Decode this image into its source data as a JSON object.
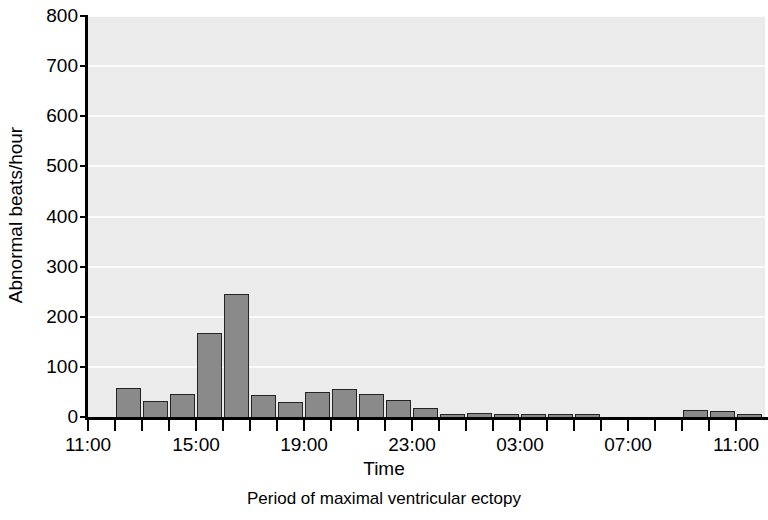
{
  "chart_data": {
    "type": "bar",
    "title": "",
    "xlabel": "Time",
    "ylabel": "Abnormal beats/hour",
    "caption": "Period of maximal ventricular ectopy",
    "ylim": [
      0,
      800
    ],
    "yticks": [
      0,
      100,
      200,
      300,
      400,
      500,
      600,
      700,
      800
    ],
    "ytick_labels": [
      "0",
      "100",
      "200",
      "300",
      "400",
      "500",
      "600",
      "700",
      "800"
    ],
    "grid": "horizontal",
    "legend": "none",
    "x_axis_hours_start": "11:00",
    "x_axis_hours_end": "11:00",
    "xtick_labels": [
      "11:00",
      "15:00",
      "19:00",
      "23:00",
      "03:00",
      "07:00",
      "11:00"
    ],
    "xtick_label_hour_index": [
      0,
      4,
      8,
      12,
      16,
      20,
      24
    ],
    "hour_ticks_total": 25,
    "categories": [
      "11:00",
      "12:00",
      "13:00",
      "14:00",
      "15:00",
      "16:00",
      "17:00",
      "18:00",
      "19:00",
      "20:00",
      "21:00",
      "22:00",
      "23:00",
      "00:00",
      "01:00",
      "02:00",
      "03:00",
      "04:00",
      "05:00",
      "06:00",
      "07:00",
      "08:00",
      "09:00",
      "10:00",
      "11:00"
    ],
    "values": [
      0,
      58,
      31,
      46,
      168,
      245,
      44,
      29,
      50,
      55,
      45,
      33,
      17,
      3,
      9,
      4,
      3,
      3,
      3,
      0,
      0,
      0,
      14,
      12,
      5
    ],
    "bar_color": "#8a8a8a",
    "bar_edge_color": "#242424",
    "plot_background": "#ebebeb",
    "gridline_color": "#fbfbfb",
    "axis_color": "#000000"
  },
  "figure": {
    "ylabel": "Abnormal beats/hour",
    "xlabel": "Time",
    "caption": "Period of maximal ventricular ectopy"
  }
}
